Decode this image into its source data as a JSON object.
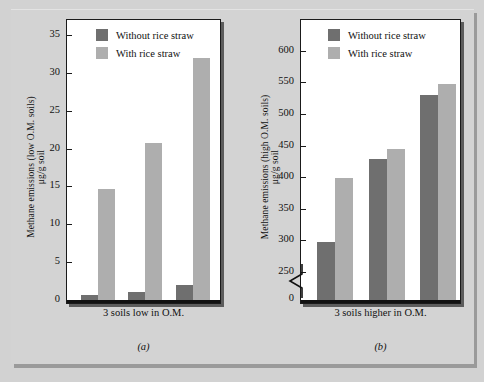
{
  "figure": {
    "background_color": "#d2d2d2",
    "panel_background": "#ffffff",
    "series_colors": {
      "without_rice_straw": "#6f6f6f",
      "with_rice_straw": "#aeaeae"
    }
  },
  "legend": {
    "items": [
      {
        "label": "Without rice straw",
        "color": "#6f6f6f"
      },
      {
        "label": "With rice straw",
        "color": "#aeaeae"
      }
    ]
  },
  "panel_a": {
    "caption": "(a)",
    "ylabel_line1": "Methane emissions (low O.M. soils)",
    "ylabel_line2": "μg/g soil",
    "xlabel": "3 soils low in O.M.",
    "yticks": [
      "0",
      "5",
      "10",
      "15",
      "20",
      "25",
      "30",
      "35"
    ]
  },
  "panel_b": {
    "caption": "(b)",
    "ylabel_line1": "Methane emissions (high O.M. soils)",
    "ylabel_line2": "μg/g soil",
    "xlabel": "3 soils higher in O.M.",
    "yticks": [
      "0",
      "250",
      "300",
      "350",
      "400",
      "450",
      "500",
      "550",
      "600"
    ]
  },
  "chart_data": [
    {
      "type": "bar",
      "panel": "(a)",
      "title": "Methane emissions from 3 soils low in organic matter",
      "xlabel": "3 soils low in O.M.",
      "ylabel": "Methane emissions (low O.M. soils) μg/g soil",
      "categories": [
        "Soil 1",
        "Soil 2",
        "Soil 3"
      ],
      "series": [
        {
          "name": "Without rice straw",
          "color": "#6f6f6f",
          "values": [
            0.7,
            1.0,
            2.0
          ]
        },
        {
          "name": "With rice straw",
          "color": "#aeaeae",
          "values": [
            14.7,
            20.7,
            32.0
          ]
        }
      ],
      "ylim": [
        0,
        37
      ],
      "ytick_values": [
        0,
        5,
        10,
        15,
        20,
        25,
        30,
        35
      ],
      "grid": false,
      "legend_position": "top-left inside",
      "axis_break": false
    },
    {
      "type": "bar",
      "panel": "(b)",
      "title": "Methane emissions from 3 soils higher in organic matter",
      "xlabel": "3 soils higher in O.M.",
      "ylabel": "Methane emissions (high O.M. soils) μg/g soil",
      "categories": [
        "Soil 1",
        "Soil 2",
        "Soil 3"
      ],
      "series": [
        {
          "name": "Without rice straw",
          "color": "#6f6f6f",
          "values": [
            298,
            429,
            530
          ]
        },
        {
          "name": "With rice straw",
          "color": "#aeaeae",
          "values": [
            398,
            444,
            548
          ]
        }
      ],
      "ylim": [
        250,
        620
      ],
      "ytick_values": [
        250,
        300,
        350,
        400,
        450,
        500,
        550,
        600
      ],
      "grid": false,
      "legend_position": "top-left inside",
      "axis_break": true,
      "axis_break_note": "Y axis broken between 0 and 250"
    }
  ]
}
